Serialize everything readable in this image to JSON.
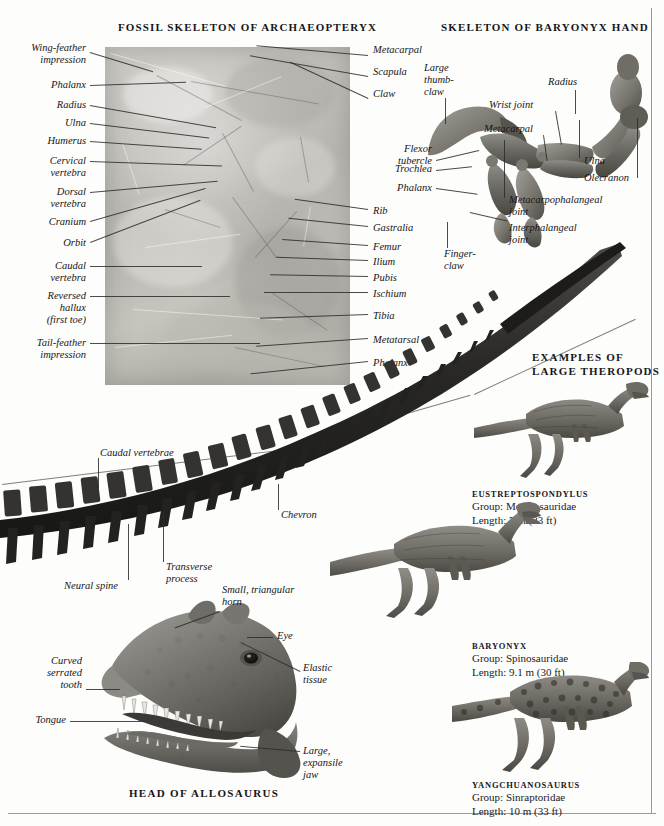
{
  "page": {
    "accent_ink": "#16161a",
    "rule_color": "#9a9a9a",
    "background": "#fdfdfb"
  },
  "sections": {
    "archaeopteryx_title": "FOSSIL SKELETON OF ARCHAEOPTERYX",
    "baryonyx_title": "SKELETON OF BARYONYX HAND",
    "theropods_title": "EXAMPLES OF\nLARGE THEROPODS",
    "allosaurus_title": "HEAD OF ALLOSAURUS"
  },
  "archaeopteryx_labels_left": [
    {
      "text": "Wing-feather\nimpression"
    },
    {
      "text": "Phalanx"
    },
    {
      "text": "Radius"
    },
    {
      "text": "Ulna"
    },
    {
      "text": "Humerus"
    },
    {
      "text": "Cervical\nvertebra"
    },
    {
      "text": "Dorsal\nvertebra"
    },
    {
      "text": "Cranium"
    },
    {
      "text": "Orbit"
    },
    {
      "text": "Caudal\nvertebra"
    },
    {
      "text": "Reversed\nhallux\n(first toe)"
    },
    {
      "text": "Tail-feather\nimpression"
    }
  ],
  "archaeopteryx_labels_right": [
    {
      "text": "Metacarpal"
    },
    {
      "text": "Scapula"
    },
    {
      "text": "Claw"
    },
    {
      "text": "Rib"
    },
    {
      "text": "Gastralia"
    },
    {
      "text": "Femur"
    },
    {
      "text": "Ilium"
    },
    {
      "text": "Pubis"
    },
    {
      "text": "Ischium"
    },
    {
      "text": "Tibia"
    },
    {
      "text": "Metatarsal"
    },
    {
      "text": "Phalanx"
    }
  ],
  "baryonyx_labels": [
    {
      "text": "Large\nthumb-\nclaw"
    },
    {
      "text": "Radius"
    },
    {
      "text": "Wrist joint"
    },
    {
      "text": "Metacarpal"
    },
    {
      "text": "Ulna"
    },
    {
      "text": "Olecranon"
    },
    {
      "text": "Flexor\ntubercle"
    },
    {
      "text": "Trochlea"
    },
    {
      "text": "Phalanx"
    },
    {
      "text": "Metacarpophalangeal\njoint"
    },
    {
      "text": "Interphalangeal\njoint"
    },
    {
      "text": "Finger-\nclaw"
    }
  ],
  "tail_labels": [
    {
      "text": "Caudal vertebrae"
    },
    {
      "text": "Chevron"
    },
    {
      "text": "Transverse\nprocess"
    },
    {
      "text": "Neural spine"
    }
  ],
  "allosaurus_labels": [
    {
      "text": "Small, triangular\nhorn"
    },
    {
      "text": "Eye"
    },
    {
      "text": "Curved\nserrated\ntooth"
    },
    {
      "text": "Elastic\ntissue"
    },
    {
      "text": "Tongue"
    },
    {
      "text": "Large,\nexpansile\njaw"
    }
  ],
  "theropods": [
    {
      "name": "EUSTREPTOSPONDYLUS",
      "group_label": "Group: Megalosauridae",
      "length_label": "Length: 7 m (23 ft)",
      "group": "Megalosauridae",
      "length_m": 7,
      "length_ft": 23
    },
    {
      "name": "BARYONYX",
      "group_label": "Group: Spinosauridae",
      "length_label": "Length: 9.1 m (30 ft)",
      "group": "Spinosauridae",
      "length_m": 9.1,
      "length_ft": 30
    },
    {
      "name": "YANGCHUANOSAURUS",
      "group_label": "Group: Sinraptoridae",
      "length_label": "Length: 10 m (33 ft)",
      "group": "Sinraptoridae",
      "length_m": 10,
      "length_ft": 33
    }
  ]
}
